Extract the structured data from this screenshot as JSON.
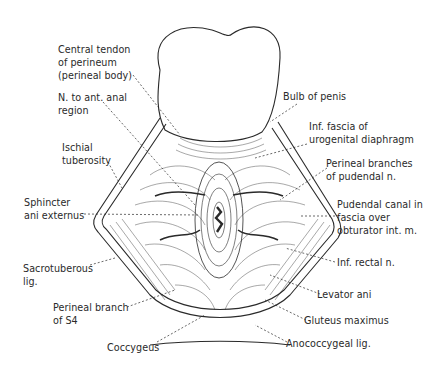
{
  "figure": {
    "colors": {
      "ink": "#2a2a2a",
      "background": "#ffffff"
    }
  },
  "labels": {
    "central_tendon": "Central tendon\nof perineum\n(perineal body)",
    "n_ant_anal": "N. to ant. anal\nregion",
    "ischial_tuberosity": "Ischial\ntuberosity",
    "sphincter_ani": "Sphincter\nani externus",
    "sacrotuberous": "Sacrotuberous\nlig.",
    "perineal_branch_s4": "Perineal branch\nof S4",
    "coccygeus": "Coccygeus",
    "bulb_of_penis": "Bulb of penis",
    "inf_fascia": "Inf. fascia of\nurogenital diaphragm",
    "perineal_branches": "Perineal branches\nof pudendal n.",
    "pudendal_canal": "Pudendal canal in\nfascia over\nobturator int. m.",
    "inf_rectal": "Inf. rectal n.",
    "levator_ani": "Levator ani",
    "gluteus_maximus": "Gluteus maximus",
    "anococcygeal": "Anococcygeal lig."
  }
}
